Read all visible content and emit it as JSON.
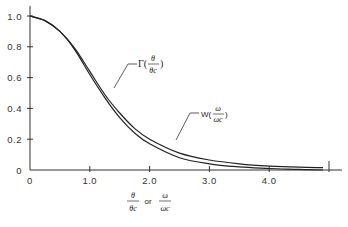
{
  "chart_data": {
    "type": "line",
    "title": "",
    "xlabel": "θ/θc or ω/ωc",
    "ylabel": "",
    "xlim": [
      0,
      5.0
    ],
    "ylim": [
      0,
      1.05
    ],
    "grid": false,
    "legend": "inline annotations",
    "x_ticks": [
      "0",
      "1.0",
      "2.0",
      "3.0",
      "4.0"
    ],
    "y_ticks": [
      "0",
      "0.2",
      "0.4",
      "0.6",
      "0.8",
      "1.0"
    ],
    "series": [
      {
        "name": "Γ(θ/θc)",
        "x": [
          0,
          0.25,
          0.5,
          0.75,
          1.0,
          1.25,
          1.5,
          1.75,
          2.0,
          2.5,
          3.0,
          3.5,
          4.0,
          4.5,
          4.9
        ],
        "y": [
          1.0,
          0.97,
          0.9,
          0.78,
          0.62,
          0.47,
          0.34,
          0.24,
          0.17,
          0.08,
          0.04,
          0.02,
          0.01,
          0.004,
          0.0
        ]
      },
      {
        "name": "W(ω/ωc)",
        "x": [
          0,
          0.25,
          0.5,
          0.75,
          1.0,
          1.25,
          1.5,
          1.75,
          2.0,
          2.5,
          3.0,
          3.5,
          4.0,
          4.5,
          4.9
        ],
        "y": [
          1.0,
          0.97,
          0.9,
          0.79,
          0.64,
          0.49,
          0.37,
          0.27,
          0.2,
          0.11,
          0.065,
          0.04,
          0.025,
          0.018,
          0.015
        ]
      }
    ],
    "annotations": [
      {
        "text": "Γ(θ/θc)",
        "points_to": "Γ(θ/θc)",
        "at_x": 1.45
      },
      {
        "text": "W(ω/ωc)",
        "points_to": "W(ω/ωc)",
        "at_x": 2.45
      }
    ]
  },
  "labels": {
    "gamma_prefix": "Γ(",
    "gamma_num": "θ",
    "gamma_den": "θc",
    "gamma_suffix": ")",
    "w_prefix": "W(",
    "w_num": "ω",
    "w_den": "ωc",
    "w_suffix": ")",
    "x_theta_num": "θ",
    "x_theta_den": "θc",
    "x_or": "or",
    "x_omega_num": "ω",
    "x_omega_den": "ωc"
  }
}
